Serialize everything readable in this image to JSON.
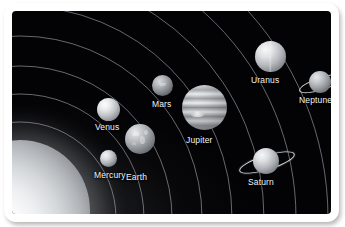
{
  "figure": {
    "background_color": "#040406",
    "frame_color": "#ffffff",
    "label_color": "#f2f3f4",
    "orbit_line_color": "#b8bbbf"
  },
  "sun": {
    "name": "Sun",
    "position": "lower-left",
    "glow_color": "#ffffff"
  },
  "planets": [
    {
      "id": "mercury",
      "label": "Mercury",
      "order": 1,
      "has_rings": false
    },
    {
      "id": "venus",
      "label": "Venus",
      "order": 2,
      "has_rings": false
    },
    {
      "id": "earth",
      "label": "Earth",
      "order": 3,
      "has_rings": false
    },
    {
      "id": "mars",
      "label": "Mars",
      "order": 4,
      "has_rings": false
    },
    {
      "id": "jupiter",
      "label": "Jupiter",
      "order": 5,
      "has_rings": false
    },
    {
      "id": "saturn",
      "label": "Saturn",
      "order": 6,
      "has_rings": true
    },
    {
      "id": "uranus",
      "label": "Uranus",
      "order": 7,
      "has_rings": false
    },
    {
      "id": "neptune",
      "label": "Neptune",
      "order": 8,
      "has_rings": true
    }
  ],
  "orbits": {
    "count": 8,
    "shape": "concentric-arcs-centered-on-sun"
  }
}
